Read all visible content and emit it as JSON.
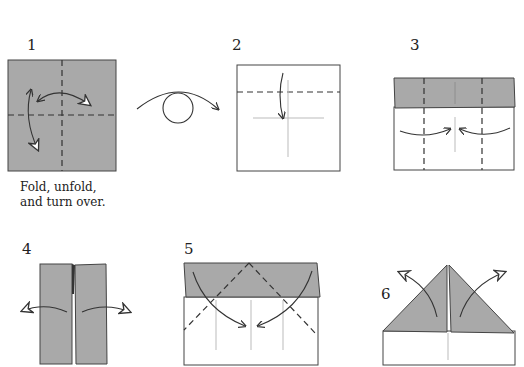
{
  "diagram": {
    "colors": {
      "paper_colored": "#a9a9a9",
      "paper_white": "#ffffff",
      "line": "#333333",
      "crease": "#b0b0b0"
    },
    "steps": [
      {
        "number": "1",
        "caption_line1": "Fold, unfold,",
        "caption_line2": "and turn over."
      },
      {
        "number": "2",
        "caption_line1": "",
        "caption_line2": ""
      },
      {
        "number": "3",
        "caption_line1": "",
        "caption_line2": ""
      },
      {
        "number": "4",
        "caption_line1": "",
        "caption_line2": ""
      },
      {
        "number": "5",
        "caption_line1": "",
        "caption_line2": ""
      },
      {
        "number": "6",
        "caption_line1": "",
        "caption_line2": ""
      }
    ],
    "symbols": [
      "turn-over-icon",
      "valley-fold-line",
      "crease-line",
      "fold-arrow",
      "unfold-arrow",
      "open-arrow"
    ]
  }
}
